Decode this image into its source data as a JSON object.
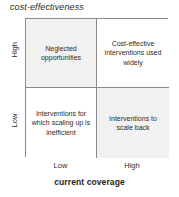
{
  "chart_data": {
    "type": "table",
    "title": "cost-effectiveness",
    "xlabel": "current coverage",
    "ylabel": "cost-effectiveness",
    "x_categories": [
      "Low",
      "High"
    ],
    "y_categories": [
      "High",
      "Low"
    ],
    "grid": true,
    "legend": "none",
    "cells": [
      {
        "row": "High",
        "column": "Low",
        "position": "top-left",
        "label": "Neglected opportunities",
        "fill": "#f1f1f1"
      },
      {
        "row": "High",
        "column": "High",
        "position": "top-right",
        "label": "Cost-effective interventions used widely",
        "fill": "#ffffff"
      },
      {
        "row": "Low",
        "column": "Low",
        "position": "bottom-left",
        "label": "Interventions for which scaling up is inefficient",
        "fill": "#ffffff"
      },
      {
        "row": "Low",
        "column": "High",
        "position": "bottom-right",
        "label": "Interventions to scale back",
        "fill": "#f1f1f1"
      }
    ]
  },
  "figure": {
    "title": "cost-effectiveness",
    "y_axis": {
      "high_label": "High",
      "low_label": "Low"
    },
    "x_axis": {
      "low_label": "Low",
      "high_label": "High",
      "title": "current coverage"
    },
    "quadrants": {
      "top_left": "Neglected opportunities",
      "top_right": "Cost-effective interventions used widely",
      "bottom_left": "Interventions for which scaling up is inefficient",
      "bottom_right": "Interventions to scale back"
    },
    "colors": {
      "gray_fill": "#f1f1f1",
      "white_fill": "#ffffff",
      "border": "#8a8a8a",
      "text": "#2b2b2b"
    }
  }
}
